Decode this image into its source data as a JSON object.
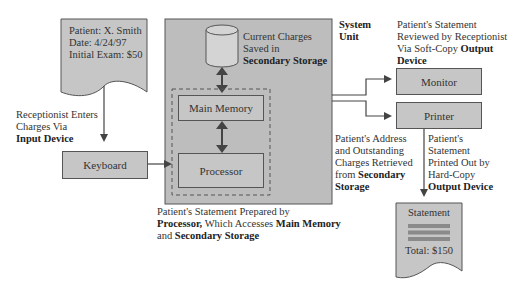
{
  "diagram": {
    "input_document": {
      "lines": [
        "Patient: X. Smith",
        "Date: 4/24/97",
        "Initial Exam: $50"
      ]
    },
    "input_label": {
      "line1": "Receptionist Enters",
      "line2": "Charges Via",
      "line3": "Input Device"
    },
    "keyboard": {
      "label": "Keyboard"
    },
    "system_unit": {
      "label_line1": "System",
      "label_line2": "Unit",
      "storage_label": {
        "line1": "Current Charges",
        "line2": "Saved in",
        "line3": "Secondary Storage"
      },
      "main_memory": "Main Memory",
      "processor": "Processor"
    },
    "processor_caption": {
      "line1": "Patient's Statement Prepared by",
      "line2_bold1": "Processor,",
      "line2_plain": " Which Accesses ",
      "line2_bold2": "Main Memory",
      "line3_plain": "and ",
      "line3_bold": "Secondary Storage"
    },
    "monitor": {
      "label": "Monitor"
    },
    "printer": {
      "label": "Printer"
    },
    "monitor_caption": {
      "line1": "Patient's Statement",
      "line2": "Reviewed by Receptionist",
      "line3_plain": "Via Soft-Copy ",
      "line3_bold": "Output",
      "line4_bold": "Device"
    },
    "retrieval_caption": {
      "line1": "Patient's Address",
      "line2": "and Outstanding",
      "line3": "Charges Retrieved",
      "line4_plain": "from ",
      "line4_bold": "Secondary",
      "line5_bold": "Storage"
    },
    "printer_caption": {
      "line1": "Patient's",
      "line2": "Statement",
      "line3": "Printed Out by",
      "line4": "Hard-Copy",
      "line5_bold": "Output Device"
    },
    "output_document": {
      "title": "Statement",
      "total": "Total: $150"
    }
  },
  "colors": {
    "box_fill": "#c6c6c6",
    "system_unit_fill": "#bdbdbd",
    "outline": "#555555",
    "bar_fill": "#8a8a8a"
  }
}
